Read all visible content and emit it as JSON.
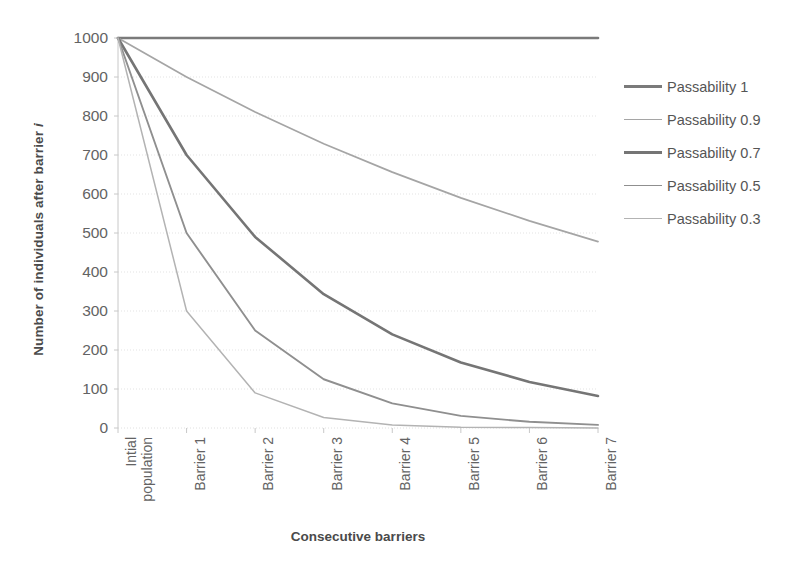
{
  "chart_data": {
    "type": "line",
    "title": "",
    "xlabel": "Consecutive barriers",
    "ylabel": "Number of individuals after barrier i",
    "categories": [
      "Intial\npopulation",
      "Barrier 1",
      "Barrier 2",
      "Barrier 3",
      "Barrier 4",
      "Barrier 5",
      "Barrier 6",
      "Barrier 7"
    ],
    "yticks": [
      1000,
      900,
      800,
      700,
      600,
      500,
      400,
      300,
      200,
      100,
      0
    ],
    "ylim": [
      0,
      1000
    ],
    "grid": "horizontal",
    "legend_position": "right",
    "series": [
      {
        "name": "Passability 1",
        "passability": 1,
        "color": "#7a7a7a",
        "width": 2.6,
        "values": [
          1000,
          1000,
          1000,
          1000,
          1000,
          1000,
          1000,
          1000
        ]
      },
      {
        "name": "Passability 0.9",
        "passability": 0.9,
        "color": "#a5a5a5",
        "width": 1.7,
        "values": [
          1000,
          900,
          810,
          729,
          656,
          590,
          531,
          478
        ]
      },
      {
        "name": "Passability 0.7",
        "passability": 0.7,
        "color": "#757575",
        "width": 2.6,
        "values": [
          1000,
          700,
          490,
          343,
          240,
          168,
          118,
          82
        ]
      },
      {
        "name": "Passability 0.5",
        "passability": 0.5,
        "color": "#8f8f8f",
        "width": 1.9,
        "values": [
          1000,
          500,
          250,
          125,
          63,
          31,
          16,
          8
        ]
      },
      {
        "name": "Passability 0.3",
        "passability": 0.3,
        "color": "#b3b3b3",
        "width": 1.5,
        "values": [
          1000,
          300,
          90,
          27,
          8,
          2,
          1,
          0
        ]
      }
    ],
    "colors": {
      "axis": "#c8c8c8",
      "grid": "#dcdcdc",
      "tick_text": "#636363",
      "axis_title": "#4a4a4a",
      "legend_text": "#555555",
      "background": "#ffffff"
    }
  }
}
